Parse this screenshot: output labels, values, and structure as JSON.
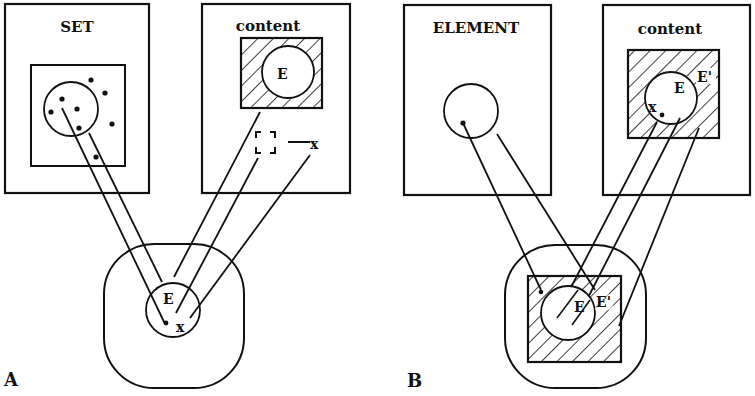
{
  "panels": {
    "A": {
      "label": "A",
      "set_box": {
        "title": "SET"
      },
      "content_box": {
        "title": "content",
        "circle_label": "E",
        "point_label": "x"
      },
      "result": {
        "circle_label": "E",
        "point_label": "x"
      }
    },
    "B": {
      "label": "B",
      "element_box": {
        "title": "ELEMENT"
      },
      "content_box": {
        "title": "content",
        "circle_label": "E",
        "complement_label": "E'",
        "point_label": "x"
      },
      "result": {
        "circle_label": "E",
        "complement_label": "E'"
      }
    }
  },
  "colors": {
    "ink": "#111111",
    "background": "#ffffff"
  }
}
